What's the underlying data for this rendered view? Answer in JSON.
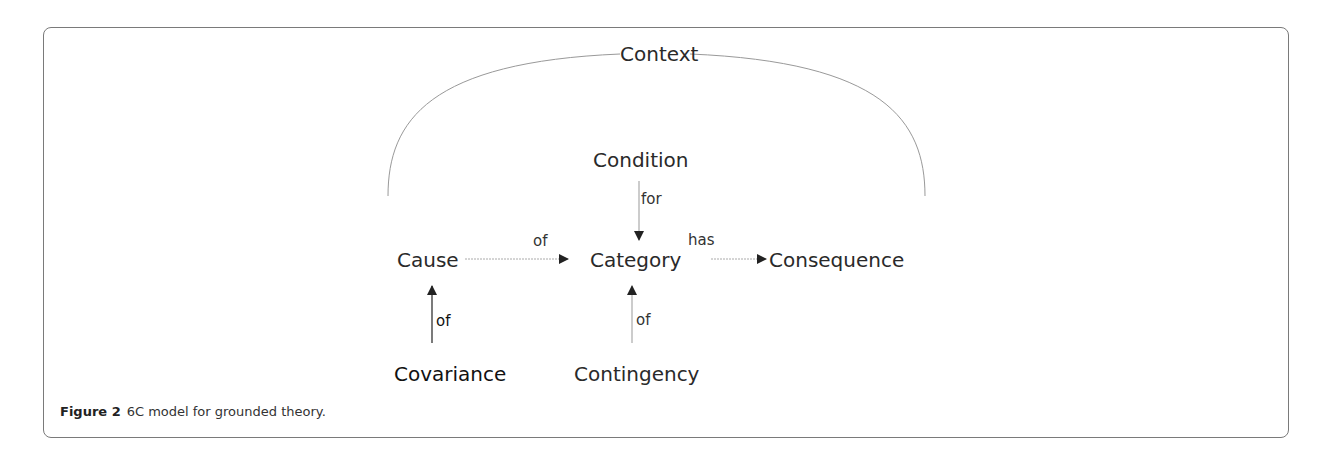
{
  "figure": {
    "label": "Figure 2",
    "caption": "6C model for grounded theory."
  },
  "nodes": {
    "context": "Context",
    "condition": "Condition",
    "cause": "Cause",
    "category": "Category",
    "consequence": "Consequence",
    "covariance": "Covariance",
    "contingency": "Contingency"
  },
  "edges": [
    {
      "from": "Condition",
      "to": "Category",
      "label": "for"
    },
    {
      "from": "Cause",
      "to": "Category",
      "label": "of"
    },
    {
      "from": "Category",
      "to": "Consequence",
      "label": "has"
    },
    {
      "from": "Covariance",
      "to": "Cause",
      "label": "of"
    },
    {
      "from": "Contingency",
      "to": "Category",
      "label": "of"
    }
  ],
  "edge_labels": {
    "condition_category": "for",
    "cause_category": "of",
    "category_consequence": "has",
    "covariance_cause": "of",
    "contingency_category": "of"
  }
}
